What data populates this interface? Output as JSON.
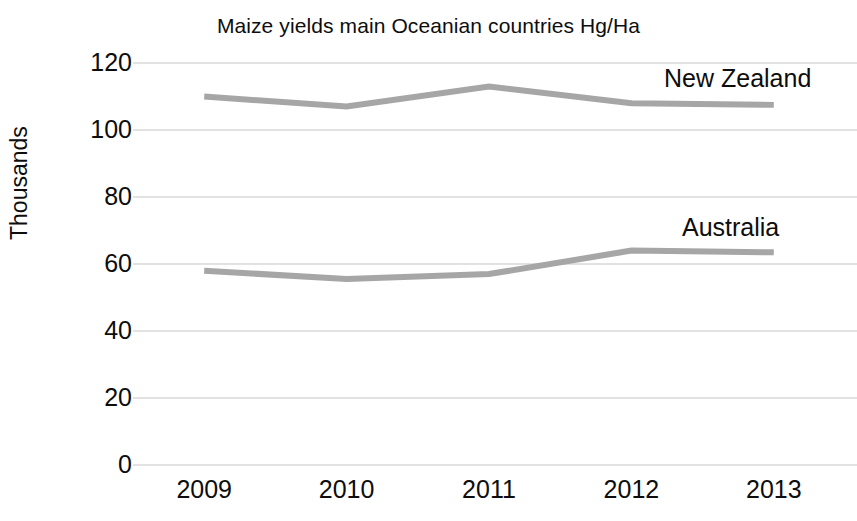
{
  "chart_data": {
    "type": "line",
    "title": "Maize yields main Oceanian countries Hg/Ha",
    "xlabel": "",
    "ylabel": "Thousands",
    "categories": [
      "2009",
      "2010",
      "2011",
      "2012",
      "2013"
    ],
    "x": [
      2009,
      2010,
      2011,
      2012,
      2013
    ],
    "series": [
      {
        "name": "New Zealand",
        "values": [
          110,
          107,
          113,
          108,
          107.5
        ],
        "color": "#a6a6a6"
      },
      {
        "name": "Australia",
        "values": [
          58,
          55.5,
          57,
          64,
          63.5
        ],
        "color": "#a6a6a6"
      }
    ],
    "ylim": [
      0,
      120
    ],
    "yticks": [
      0,
      20,
      40,
      60,
      80,
      100,
      120
    ],
    "ytick_labels": [
      "0",
      "20",
      "40",
      "60",
      "80",
      "100",
      "120"
    ],
    "grid": true,
    "grid_axis": "y",
    "grid_color": "#d9d9d9",
    "legend": "inline-series-labels",
    "legend_position": "right-inline",
    "background": "#ffffff",
    "text_color": "#0d0d0d",
    "line_width": 6
  },
  "labels": {
    "title": "Maize yields main Oceanian countries Hg/Ha",
    "y_axis_title": "Thousands",
    "series_new_zealand": "New Zealand",
    "series_australia": "Australia"
  }
}
